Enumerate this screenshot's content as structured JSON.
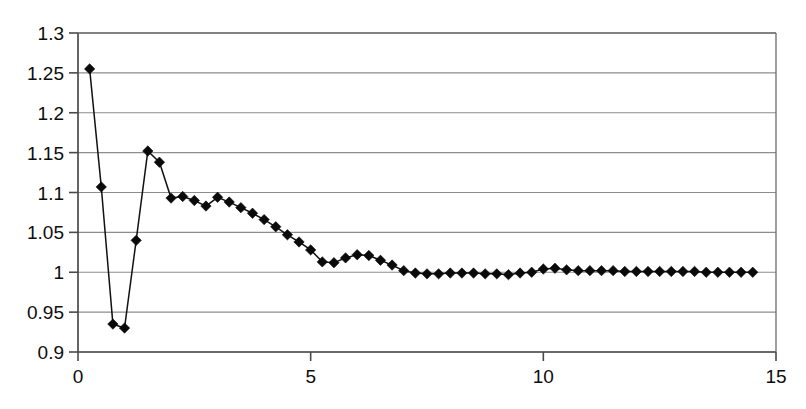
{
  "chart_data": {
    "type": "line",
    "title": "",
    "subtitle": "",
    "xlabel": "",
    "ylabel": "",
    "xlim": [
      0,
      15
    ],
    "ylim": [
      0.9,
      1.3
    ],
    "grid": true,
    "legend": false,
    "legend_position": "none",
    "marker": "diamond",
    "marker_color": "#0a0a0a",
    "line_color": "#111111",
    "background_color": "#ffffff",
    "gridline_color": "#8d8d8d",
    "axis_color": "#4a4a4a",
    "xticks": [
      0,
      5,
      10,
      15
    ],
    "xtick_labels": [
      "0",
      "5",
      "10",
      "15"
    ],
    "yticks": [
      0.9,
      0.95,
      1,
      1.05,
      1.1,
      1.15,
      1.2,
      1.25,
      1.3
    ],
    "ytick_labels": [
      "0.9",
      "0.95",
      "1",
      "1.05",
      "1.1",
      "1.15",
      "1.2",
      "1.25",
      "1.3"
    ],
    "series": [
      {
        "name": "series-1",
        "x": [
          0.25,
          0.5,
          0.75,
          1.0,
          1.25,
          1.5,
          1.75,
          2.0,
          2.25,
          2.5,
          2.75,
          3.0,
          3.25,
          3.5,
          3.75,
          4.0,
          4.25,
          4.5,
          4.75,
          5.0,
          5.25,
          5.5,
          5.75,
          6.0,
          6.25,
          6.5,
          6.75,
          7.0,
          7.25,
          7.5,
          7.75,
          8.0,
          8.25,
          8.5,
          8.75,
          9.0,
          9.25,
          9.5,
          9.75,
          10.0,
          10.25,
          10.5,
          10.75,
          11.0,
          11.25,
          11.5,
          11.75,
          12.0,
          12.25,
          12.5,
          12.75,
          13.0,
          13.25,
          13.5,
          13.75,
          14.0,
          14.25,
          14.5
        ],
        "values": [
          1.255,
          1.107,
          0.935,
          0.93,
          1.04,
          1.152,
          1.138,
          1.093,
          1.095,
          1.09,
          1.083,
          1.094,
          1.088,
          1.081,
          1.074,
          1.066,
          1.057,
          1.047,
          1.038,
          1.028,
          1.013,
          1.012,
          1.018,
          1.022,
          1.021,
          1.015,
          1.009,
          1.002,
          0.999,
          0.998,
          0.998,
          0.999,
          0.999,
          0.999,
          0.998,
          0.998,
          0.997,
          0.999,
          1.0,
          1.004,
          1.005,
          1.003,
          1.002,
          1.002,
          1.002,
          1.002,
          1.001,
          1.001,
          1.001,
          1.001,
          1.001,
          1.001,
          1.001,
          1.0,
          1.0,
          1.0,
          1.0,
          1.0
        ]
      }
    ]
  }
}
